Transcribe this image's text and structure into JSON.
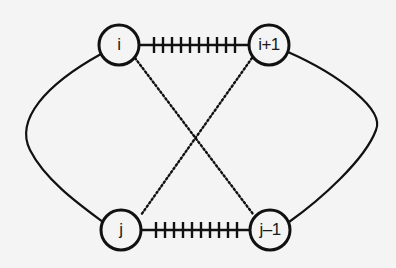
{
  "diagram": {
    "colors": {
      "background": "#f4f4f4",
      "stroke": "#111111"
    },
    "nodes": [
      {
        "id": "i",
        "label": "i",
        "cx": 119,
        "cy": 45
      },
      {
        "id": "i+1",
        "label": "i+1",
        "cx": 269,
        "cy": 45
      },
      {
        "id": "j",
        "label": "j",
        "cx": 121,
        "cy": 230
      },
      {
        "id": "j-1",
        "label": "j–1",
        "cx": 270,
        "cy": 230
      }
    ],
    "edges": [
      {
        "from": "i",
        "to": "i+1",
        "style": "hatched",
        "ticks": 10
      },
      {
        "from": "j",
        "to": "j-1",
        "style": "hatched",
        "ticks": 10
      },
      {
        "from": "i",
        "to": "j-1",
        "style": "dotted"
      },
      {
        "from": "i+1",
        "to": "j",
        "style": "dotted"
      },
      {
        "from": "i",
        "to": "j",
        "style": "solid-curve",
        "side": "left"
      },
      {
        "from": "i+1",
        "to": "j-1",
        "style": "solid-curve",
        "side": "right"
      }
    ]
  }
}
